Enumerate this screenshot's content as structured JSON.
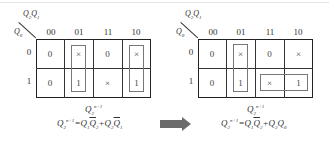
{
  "left_map": {
    "top_var": "Q2Q1",
    "left_var": "Q0",
    "columns": [
      "00",
      "01",
      "11",
      "10"
    ],
    "rows": [
      "0",
      "1"
    ],
    "cells": [
      [
        "0",
        "×",
        "0",
        "×"
      ],
      [
        "0",
        "1",
        "×",
        "1"
      ]
    ],
    "loops": [
      {
        "cells": "column 01, rows 0-1"
      },
      {
        "cells": "column 10, rows 0-1"
      }
    ],
    "caption": "Q2 n+1",
    "equation": "Q2n+1 = Q1 Q̄2 + Q2 Q̄1"
  },
  "right_map": {
    "top_var": "Q2Q1",
    "left_var": "Q0",
    "columns": [
      "00",
      "01",
      "11",
      "10"
    ],
    "rows": [
      "0",
      "1"
    ],
    "cells": [
      [
        "0",
        "×",
        "0",
        "×"
      ],
      [
        "0",
        "1",
        "×",
        "1"
      ]
    ],
    "loops": [
      {
        "cells": "column 01, rows 0-1"
      },
      {
        "cells": "row 1, columns 11-10"
      }
    ],
    "caption": "Q2 n+1",
    "equation": "Q2n+1 = Q1 Q̄2 + Q2 Q0"
  },
  "arrow": {
    "direction": "right",
    "color": "#6b6b6b"
  },
  "labels": {
    "Q": "Q",
    "n1": "n+1",
    "s0": "0",
    "s1": "1",
    "s2": "2",
    "eq": "=",
    "plus": "+"
  }
}
